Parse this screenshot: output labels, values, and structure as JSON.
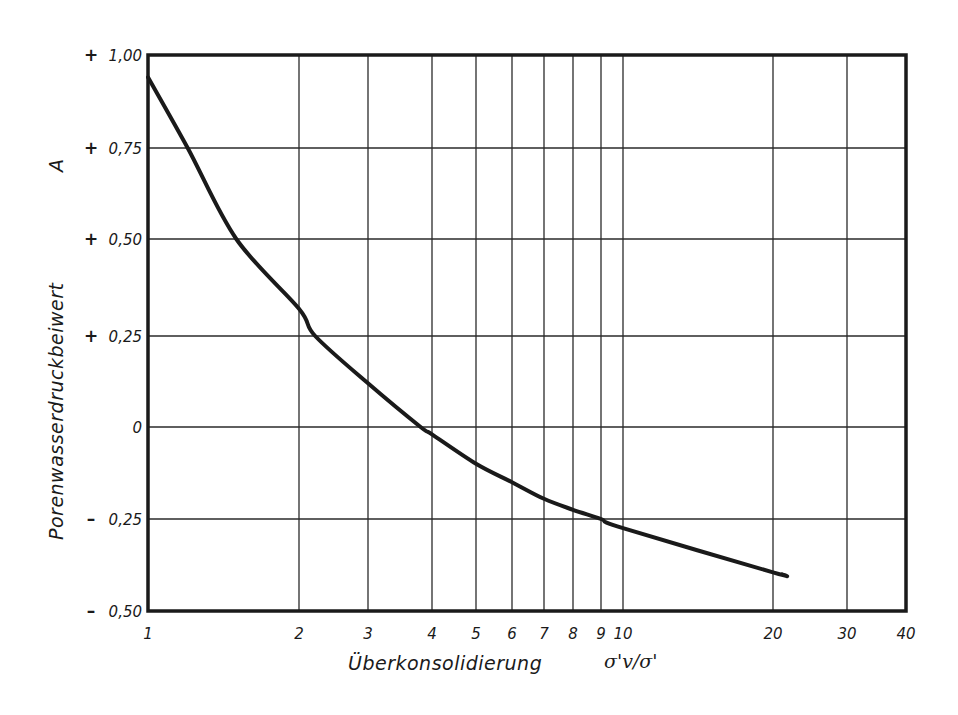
{
  "chart_data": {
    "type": "line",
    "title": "",
    "xlabel": "Überkonsolidierung",
    "xlabel_symbol": "σ'v/σ'",
    "ylabel": "Porenwasserdruckbeiwert",
    "ylabel_symbol": "A",
    "xscale": "log",
    "xlim": [
      1,
      40
    ],
    "ylim": [
      -0.5,
      1.0
    ],
    "grid": true,
    "legend": null,
    "x_ticks": [
      {
        "value": 1,
        "label": "1",
        "px": 148
      },
      {
        "value": 2,
        "label": "2",
        "px": 299
      },
      {
        "value": 3,
        "label": "3",
        "px": 368
      },
      {
        "value": 4,
        "label": "4",
        "px": 432
      },
      {
        "value": 5,
        "label": "5",
        "px": 476
      },
      {
        "value": 6,
        "label": "6",
        "px": 512
      },
      {
        "value": 7,
        "label": "7",
        "px": 544
      },
      {
        "value": 8,
        "label": "8",
        "px": 573
      },
      {
        "value": 9,
        "label": "9",
        "px": 601
      },
      {
        "value": 10,
        "label": "10",
        "px": 623
      },
      {
        "value": 20,
        "label": "20",
        "px": 773
      },
      {
        "value": 30,
        "label": "30",
        "px": 847
      },
      {
        "value": 40,
        "label": "40",
        "px": 906
      }
    ],
    "y_ticks": [
      {
        "value": 1.0,
        "sign": "+",
        "label": "1,00",
        "px": 55
      },
      {
        "value": 0.75,
        "sign": "+",
        "label": "0,75",
        "px": 148
      },
      {
        "value": 0.5,
        "sign": "+",
        "label": "0,50",
        "px": 239
      },
      {
        "value": 0.25,
        "sign": "+",
        "label": "0,25",
        "px": 336
      },
      {
        "value": 0.0,
        "sign": "",
        "label": "0",
        "px": 427
      },
      {
        "value": -0.25,
        "sign": "–",
        "label": "0,25",
        "px": 519
      },
      {
        "value": -0.5,
        "sign": "–",
        "label": "0,50",
        "px": 611
      }
    ],
    "series": [
      {
        "name": "A vs. Überkonsolidierung",
        "x": [
          1,
          1.2,
          1.5,
          2,
          2.2,
          3,
          3.8,
          4,
          5,
          6,
          7,
          8,
          9,
          10,
          20,
          21
        ],
        "y": [
          0.94,
          0.75,
          0.5,
          0.32,
          0.25,
          0.12,
          0.0,
          -0.02,
          -0.1,
          -0.15,
          -0.195,
          -0.225,
          -0.25,
          -0.275,
          -0.395,
          -0.4
        ]
      }
    ]
  },
  "plot_area": {
    "left": 148,
    "top": 55,
    "right": 906,
    "bottom": 611
  },
  "colors": {
    "ink": "#1a1a1a",
    "grid": "#2a2a2a",
    "background": "#ffffff"
  }
}
